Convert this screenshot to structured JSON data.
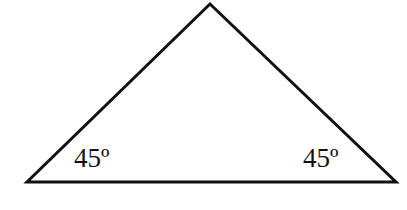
{
  "diagram": {
    "type": "triangle",
    "stroke_color": "#111111",
    "fill_color": "#ffffff",
    "vertices": {
      "top": [
        210,
        4
      ],
      "bottom_left": [
        27,
        182
      ],
      "bottom_right": [
        396,
        182
      ]
    },
    "angle_labels": [
      {
        "position": "bottom-left",
        "text": "45º"
      },
      {
        "position": "bottom-right",
        "text": "45º"
      }
    ]
  }
}
